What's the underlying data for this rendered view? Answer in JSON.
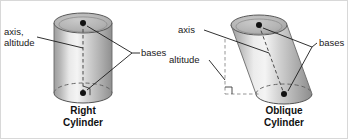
{
  "figure": {
    "background_color": "#ffffff",
    "border_color": "#d8d8d8",
    "ink_color": "#1a1a1a"
  },
  "right_cylinder": {
    "caption_line1": "Right",
    "caption_line2": "Cylinder",
    "labels": {
      "axis_altitude_line1": "axis,",
      "axis_altitude_line2": "altitude",
      "bases": "bases"
    },
    "style": {
      "body_light": "#f2f2f2",
      "body_mid": "#c9c9c9",
      "body_dark": "#9a9a9a",
      "top_fill": "#b5b5b5",
      "outline": "#4a4a4a"
    },
    "geometry": {
      "center_x": 82,
      "top_ellipse_cy": 22,
      "bottom_ellipse_cy": 92,
      "rx": 29,
      "ry": 10
    }
  },
  "oblique_cylinder": {
    "caption_line1": "Oblique",
    "caption_line2": "Cylinder",
    "labels": {
      "axis": "axis",
      "altitude": "altitude",
      "bases": "bases"
    },
    "style": {
      "body_light": "#f2f2f2",
      "body_mid": "#c9c9c9",
      "body_dark": "#9a9a9a",
      "top_fill": "#b5b5b5",
      "outline": "#4a4a4a"
    },
    "geometry": {
      "top_center_x": 258,
      "top_center_y": 24,
      "bottom_center_x": 283,
      "bottom_center_y": 93,
      "rx": 28,
      "ry": 10
    }
  }
}
